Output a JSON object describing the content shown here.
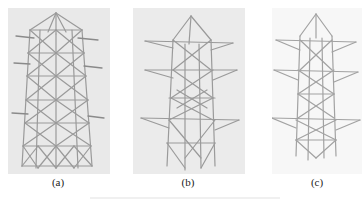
{
  "figure": {
    "panels": [
      {
        "id": "a",
        "label": "(a)",
        "description": "Tapered lattice tower model with dense cross bracing and four levels of cross-arms",
        "background": "#e9e9e9"
      },
      {
        "id": "b",
        "label": "(b)",
        "description": "Lattice tower model with pointed top and three cross-arm levels",
        "background": "#ebebeb"
      },
      {
        "id": "c",
        "label": "(c)",
        "description": "Slender lattice tower model with pointed top and three cross-arm levels",
        "background": "#f7f7f7"
      }
    ],
    "colors": {
      "member": "#9a9a9a",
      "member_dark": "#7e7e7e",
      "text": "#222222"
    }
  }
}
